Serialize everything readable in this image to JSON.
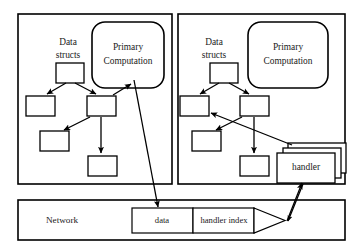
{
  "figure": {
    "background_color": "#ffffff",
    "line_color": "#000000",
    "text_color": "#1a1a1a"
  },
  "nodes": [
    {
      "id": "left-node",
      "data_structs_label": "Data\nstructs",
      "data_structs_line1": "Data",
      "data_structs_line2": "structs",
      "primary_computation_line1": "Primary",
      "primary_computation_line2": "Computation",
      "tree_boxes": 5,
      "has_handler_stack": false
    },
    {
      "id": "right-node",
      "data_structs_label": "Data\nstructs",
      "data_structs_line1": "Data",
      "data_structs_line2": "structs",
      "primary_computation_line1": "Primary",
      "primary_computation_line2": "Computation",
      "tree_boxes": 5,
      "has_handler_stack": true,
      "handler_label": "handler",
      "handler_stack_count": 3
    }
  ],
  "network": {
    "label": "Network",
    "packet": {
      "fields": [
        {
          "name": "data-field",
          "label": "data"
        },
        {
          "name": "handler-index-field",
          "label": "handler index"
        }
      ],
      "has_arrow_tip": true
    }
  },
  "edges": [
    {
      "name": "left-primary-to-packet",
      "from": "left-primary-computation",
      "to": "packet-data-field",
      "arrow": true
    },
    {
      "name": "packet-tip-to-right-handler",
      "from": "packet-arrow-tip",
      "to": "right-handler-stack",
      "arrow": true
    },
    {
      "name": "left-tree-to-primary",
      "from": "left-tree-box-mid",
      "to": "left-primary-computation",
      "arrow": true
    },
    {
      "name": "right-handler-to-tree",
      "from": "right-handler-stack",
      "to": "right-tree-box-left",
      "arrow": true
    }
  ]
}
